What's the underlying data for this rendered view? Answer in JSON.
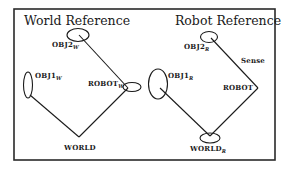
{
  "diagram": {
    "frame": {
      "x": 14,
      "y": 9,
      "width": 261,
      "height": 151,
      "color": "#2a2a2a"
    },
    "panels": [
      {
        "title": "World Reference",
        "nodes": [
          {
            "id": "OBJ2_W",
            "label": "OBJ2",
            "subscript": "W"
          },
          {
            "id": "OBJ1_W",
            "label": "OBJ1",
            "subscript": "W"
          },
          {
            "id": "ROBOT_W",
            "label": "ROBOT",
            "subscript": "W"
          },
          {
            "id": "WORLD",
            "label": "WORLD",
            "subscript": ""
          }
        ],
        "edges": [
          {
            "from": "WORLD",
            "to": "OBJ1_W"
          },
          {
            "from": "WORLD",
            "to": "ROBOT_W"
          },
          {
            "from": "ROBOT_W",
            "to": "OBJ2_W"
          }
        ]
      },
      {
        "title": "Robot Reference",
        "nodes": [
          {
            "id": "OBJ2_R",
            "label": "OBJ2",
            "subscript": "R"
          },
          {
            "id": "OBJ1_R",
            "label": "OBJ1",
            "subscript": "R"
          },
          {
            "id": "ROBOT",
            "label": "ROBOT",
            "subscript": ""
          },
          {
            "id": "WORLD_R",
            "label": "WORLD",
            "subscript": "R"
          }
        ],
        "edges": [
          {
            "from": "ROBOT",
            "to": "OBJ2_R",
            "label": "Sense"
          },
          {
            "from": "WORLD_R",
            "to": "OBJ1_R"
          },
          {
            "from": "WORLD_R",
            "to": "ROBOT"
          }
        ]
      }
    ]
  }
}
